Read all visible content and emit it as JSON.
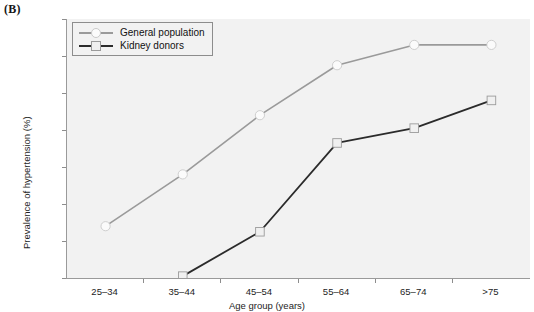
{
  "panel": {
    "label": "(B)"
  },
  "chart_data": {
    "type": "line",
    "title": "",
    "xlabel": "Age group (years)",
    "ylabel": "Prevalence of hypertension (%)",
    "categories": [
      "25–34",
      "35–44",
      "45–54",
      "55–64",
      "65–74",
      ">75"
    ],
    "ylim": [
      0,
      70
    ],
    "yticks": [
      0,
      10,
      20,
      30,
      40,
      50,
      60,
      70
    ],
    "ytick_labels": [
      "0",
      "10",
      "20",
      "30",
      "40",
      "50",
      "60",
      "70"
    ],
    "grid": false,
    "legend_position": "top-left",
    "series": [
      {
        "name": "General population",
        "values": [
          14,
          28,
          44,
          57.5,
          63,
          63
        ],
        "color": "#9a9a9a",
        "marker": "circle",
        "marker_fill": "#fbfbfb"
      },
      {
        "name": "Kidney donors",
        "values": [
          null,
          0.5,
          12.5,
          36.5,
          40.5,
          48
        ],
        "color": "#2b2b2b",
        "marker": "square",
        "marker_fill": "#f0f0f0"
      }
    ]
  },
  "colors": {
    "plot_background": "#f2f2f2",
    "axis": "#8d8d8d",
    "text": "#1d1d1d",
    "general_population": "#9a9a9a",
    "kidney_donors": "#2b2b2b"
  }
}
